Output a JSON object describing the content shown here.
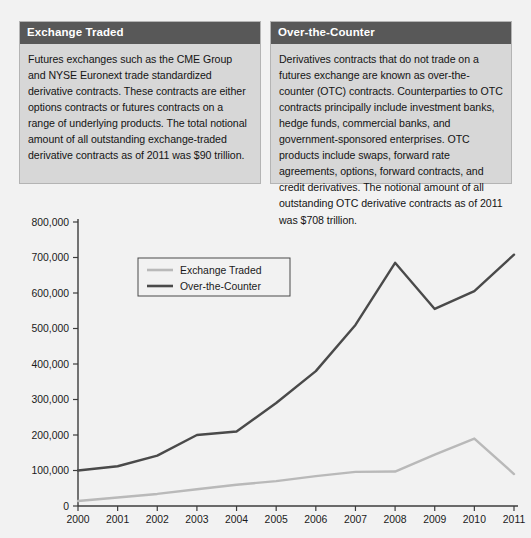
{
  "panels": [
    {
      "id": "exchange-traded",
      "title": "Exchange Traded",
      "body": "Futures exchanges such as the CME Group and NYSE Euronext trade standardized derivative contracts. These contracts are either options contracts or futures contracts on a range of underlying products. The total notional amount of all outstanding exchange-traded derivative contracts as of 2011 was $90 trillion."
    },
    {
      "id": "over-the-counter",
      "title": "Over-the-Counter",
      "body": "Derivatives contracts that do not trade on a futures exchange are known as over-the-counter (OTC) contracts. Counterparties to OTC contracts principally include investment banks, hedge funds, commercial banks, and government-sponsored enterprises. OTC products include swaps, forward rate agreements, options, forward contracts, and credit derivatives. The notional amount of all outstanding OTC derivative contracts as of 2011 was $708 trillion."
    }
  ],
  "colors": {
    "panel_header_bg": "#585858",
    "panel_bg": "#d7d7d7",
    "panel_border": "#b4b4b4",
    "page_bg": "#f2f2f2",
    "exchange_traded_line": "#b9b9b9",
    "over_the_counter_line": "#4a4a4a",
    "axis": "#3c3c3c",
    "text": "#1a1a1a"
  },
  "chart_data": {
    "type": "line",
    "title": "",
    "subtitle": "",
    "xlabel": "",
    "ylabel": "",
    "categories": [
      "2000",
      "2001",
      "2002",
      "2003",
      "2004",
      "2005",
      "2006",
      "2007",
      "2008",
      "2009",
      "2010",
      "2011"
    ],
    "x": [
      2000,
      2001,
      2002,
      2003,
      2004,
      2005,
      2006,
      2007,
      2008,
      2009,
      2010,
      2011
    ],
    "xlim": [
      2000,
      2011
    ],
    "ylim": [
      0,
      800000
    ],
    "ytick_labels": [
      "0",
      "100,000",
      "200,000",
      "300,000",
      "400,000",
      "500,000",
      "600,000",
      "700,000",
      "800,000"
    ],
    "yticks": [
      0,
      100000,
      200000,
      300000,
      400000,
      500000,
      600000,
      700000,
      800000
    ],
    "grid": false,
    "legend_position": "upper-left-inside",
    "series": [
      {
        "name": "Exchange Traded",
        "color": "#b9b9b9",
        "values": [
          14000,
          24000,
          34000,
          47000,
          60000,
          70000,
          84000,
          96000,
          97000,
          145000,
          190000,
          90000
        ]
      },
      {
        "name": "Over-the-Counter",
        "color": "#4a4a4a",
        "values": [
          100000,
          112000,
          142000,
          200000,
          210000,
          290000,
          380000,
          510000,
          685000,
          555000,
          605000,
          708000
        ]
      }
    ]
  }
}
